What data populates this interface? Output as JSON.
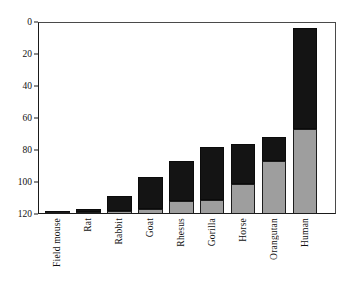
{
  "chart_data": {
    "type": "bar",
    "subtype": "stacked-bar",
    "title": "",
    "subtitle": "",
    "xlabel": "",
    "ylabel": "",
    "ylim": [
      0,
      120
    ],
    "yticks": [
      0,
      20,
      40,
      60,
      80,
      100,
      120
    ],
    "ytick_labels": [
      "0",
      "20",
      "40",
      "60",
      "80",
      "100",
      "120"
    ],
    "grid": true,
    "grid_axis": "y",
    "legend": false,
    "legend_position": "none",
    "categories": [
      "Field mouse",
      "Rat",
      "Rabbit",
      "Goat",
      "Rhesus",
      "Gorilla",
      "Horse",
      "Orangutan",
      "Human"
    ],
    "series": [
      {
        "name": "lower-segment",
        "color": "#9e9e9e",
        "values": [
          1,
          1,
          2,
          3,
          8,
          9,
          19,
          33,
          53
        ]
      },
      {
        "name": "upper-segment",
        "color": "#141414",
        "values": [
          1,
          2,
          9,
          20,
          25,
          33,
          25,
          15,
          63
        ]
      }
    ],
    "totals": [
      2,
      3,
      11,
      23,
      33,
      42,
      44,
      48,
      116
    ],
    "annotations": []
  },
  "axis": {
    "y_tick_labels": [
      "120",
      "100",
      "80",
      "60",
      "40",
      "20",
      "0"
    ]
  },
  "colors": {
    "lower_segment": "#9e9e9e",
    "upper_segment": "#141414",
    "axis": "#1a1a1a",
    "gridline": "#636363",
    "background": "#ffffff",
    "text": "#111111"
  }
}
